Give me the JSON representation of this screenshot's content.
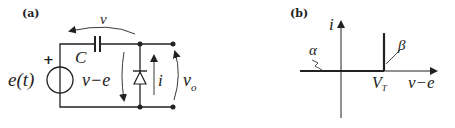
{
  "panel_a": {
    "label": "(a)",
    "voltage_top": "v",
    "capacitor": "C",
    "source": "e(t)",
    "source_polarity": "+",
    "cap_voltage": "v−e",
    "diode_current": "i",
    "output_voltage": "v",
    "output_subscript": "o"
  },
  "panel_b": {
    "label": "(b)",
    "y_axis": "i",
    "x_axis": "v−e",
    "threshold": "V",
    "threshold_subscript": "T",
    "segment_alpha": "α",
    "segment_beta": "β"
  },
  "colors": {
    "ink": "#222222",
    "background": "#ffffff"
  }
}
